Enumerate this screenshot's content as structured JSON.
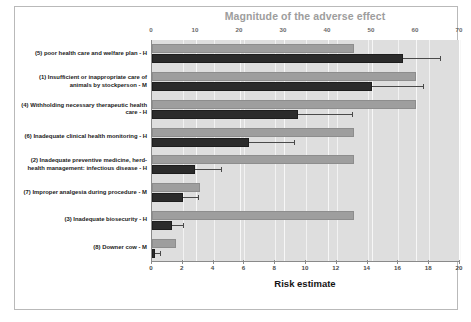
{
  "chart_data": {
    "type": "bar",
    "orientation": "horizontal",
    "title": "Magnitude of the adverse effect",
    "xlabel": "Risk estimate",
    "ylabel": "",
    "top_axis": {
      "label": "Magnitude of the adverse effect",
      "ticks": [
        0,
        10,
        20,
        30,
        40,
        50,
        60,
        70
      ],
      "lim": [
        0,
        70
      ]
    },
    "bottom_axis": {
      "label": "Risk estimate",
      "ticks": [
        0,
        2,
        4,
        6,
        8,
        10,
        12,
        14,
        16,
        18,
        20
      ],
      "lim": [
        0,
        20
      ]
    },
    "grid": true,
    "legend": "none",
    "categories": [
      "(5) poor health care and welfare plan  -  H",
      "(1) Insufficient or inappropriate care  of animals by stockperson -  M",
      "(4) Withholding necessary  therapeutic health care  -  H",
      "(6) Inadequate clinical health monitoring - H",
      "(2) Inadequate preventive medicine, herd-health management: infectious disease - H",
      "(7) Improper analgesia during procedure -  M",
      "(3) Inadequate biosecurity  -  H",
      "(8) Downer cow -  M"
    ],
    "series": [
      {
        "name": "Magnitude of the adverse effect",
        "axis": "top",
        "color": "#9e9e9e",
        "values": [
          46,
          60,
          60,
          46,
          46,
          11,
          46,
          5.5
        ]
      },
      {
        "name": "Risk estimate",
        "axis": "bottom",
        "color": "#2b2b2b",
        "values": [
          16.3,
          14.3,
          9.5,
          6.3,
          2.8,
          2.0,
          1.3,
          0.2
        ],
        "error_upper": [
          18.7,
          17.6,
          13.0,
          9.2,
          4.5,
          3.0,
          2.0,
          0.5
        ]
      }
    ],
    "colors": {
      "plot_background": "#dedede",
      "magnitude_bar": "#9e9e9e",
      "risk_bar": "#2b2b2b",
      "title": "#9d9d9d",
      "error_bar": "#4a4a4a",
      "frame": "#b9b9b9"
    }
  }
}
